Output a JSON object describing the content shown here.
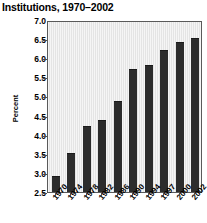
{
  "chart_data": {
    "type": "bar",
    "title": "Institutions, 1970–2002",
    "xlabel": "",
    "ylabel": "Percent",
    "categories": [
      "1970",
      "1974",
      "1978",
      "1982",
      "1986",
      "1990",
      "1994",
      "1997",
      "2000",
      "2002"
    ],
    "values": [
      2.9,
      3.5,
      4.2,
      4.35,
      4.85,
      5.7,
      5.8,
      6.2,
      6.4,
      6.5
    ],
    "series": [
      {
        "name": "Percent",
        "values": [
          2.9,
          3.5,
          4.2,
          4.35,
          4.85,
          5.7,
          5.8,
          6.2,
          6.4,
          6.5
        ]
      }
    ],
    "ylim": [
      2.5,
      7.0
    ],
    "yticks": [
      7.0,
      6.5,
      6.0,
      5.5,
      5.0,
      4.5,
      4.0,
      3.5,
      3.0,
      2.5
    ],
    "ytick_labels": [
      "7.0",
      "6.5",
      "6.0",
      "5.5",
      "5.0",
      "4.5",
      "4.0",
      "3.5",
      "3.0",
      "2.5"
    ],
    "grid": false,
    "legend": null,
    "bar_color": "#2c2c2c",
    "plot_background": "#e9e9e9",
    "xtick_rotation": -50
  }
}
